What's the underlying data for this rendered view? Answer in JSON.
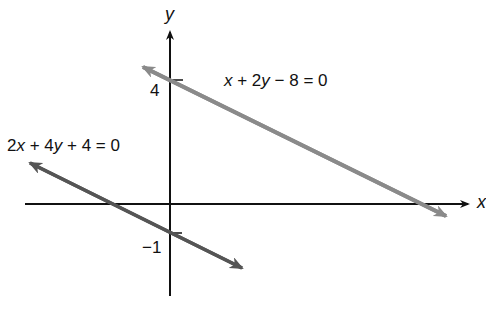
{
  "figure": {
    "axes": {
      "x_label": "x",
      "y_label": "y",
      "ticks": [
        {
          "axis": "y",
          "value": 4,
          "label": "4"
        },
        {
          "axis": "y",
          "value": -1,
          "label": "−1"
        }
      ]
    },
    "lines": [
      {
        "equation": "x + 2y − 8 = 0",
        "eq_parts": [
          "x",
          " + 2",
          "y",
          " − 8 = 0"
        ],
        "y_intercept": 4,
        "slope": -0.5,
        "color": "#8a8a8a"
      },
      {
        "equation": "2x + 4y + 4 = 0",
        "eq_parts": [
          "2",
          "x",
          " + 4",
          "y",
          " + 4 = 0"
        ],
        "y_intercept": -1,
        "slope": -0.5,
        "color": "#555555"
      }
    ],
    "axis_color": "#111111"
  }
}
